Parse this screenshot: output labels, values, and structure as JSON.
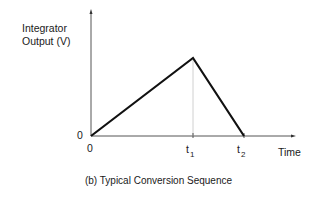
{
  "figure": {
    "caption": "(b) Typical Conversion Sequence",
    "y_axis_label_line1": "Integrator",
    "y_axis_label_line2": "Output (V)",
    "x_axis_label": "Time",
    "y_origin_label": "0",
    "x_origin_label": "0",
    "t1_base": "t",
    "t1_sub": "1",
    "t2_base": "t",
    "t2_sub": "2"
  },
  "waveform": {
    "points": [
      {
        "label": "0",
        "x": 0,
        "y": 0
      },
      {
        "label": "t1",
        "x": 1,
        "y": 1
      },
      {
        "label": "t2",
        "x": 1.5,
        "y": 0
      }
    ],
    "description": "Integrator ramps up linearly from 0 to peak at t1, then ramps down linearly to 0 at t2"
  },
  "colors": {
    "line": "#111111",
    "axis": "#555555",
    "guide": "#cccccc"
  }
}
